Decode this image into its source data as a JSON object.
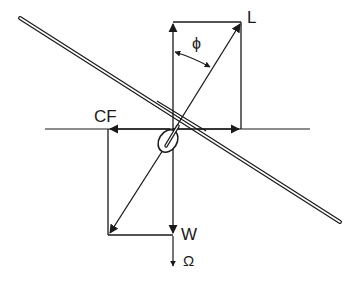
{
  "diagram": {
    "labels": {
      "lift": "L",
      "bank_angle": "ϕ",
      "centrifugal_force": "CF",
      "weight": "W",
      "resultant": "Ω"
    },
    "colors": {
      "stroke": "#1a1a1a",
      "background": "#ffffff"
    },
    "elements": [
      "glider-wing",
      "fuselage-nose",
      "horizon-line",
      "lift-vector",
      "lift-vertical-component",
      "lift-horizontal-component",
      "centrifugal-force-vector",
      "weight-vector",
      "resultant-vector",
      "bank-angle-arc"
    ]
  }
}
